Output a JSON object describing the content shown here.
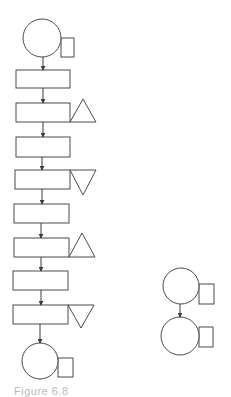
{
  "diagram": {
    "type": "process-flow-chart",
    "stroke_color": "#4a4a4a",
    "background": "#ffffff",
    "main_chain": {
      "start": {
        "shape": "operation-circle-with-tab",
        "cx": 42,
        "cy": 38,
        "r": 19,
        "tab": {
          "x": 61,
          "y": 38,
          "w": 13,
          "h": 19
        }
      },
      "steps": [
        {
          "shape": "rect",
          "x": 16,
          "y": 70,
          "w": 54,
          "h": 18,
          "marker": null
        },
        {
          "shape": "rect",
          "x": 16,
          "y": 103,
          "w": 54,
          "h": 19,
          "marker": {
            "type": "triangle-up",
            "x1": 70,
            "x2": 96,
            "apex_y": 99,
            "base_y": 122
          }
        },
        {
          "shape": "rect",
          "x": 16,
          "y": 137,
          "w": 54,
          "h": 20,
          "marker": null
        },
        {
          "shape": "rect",
          "x": 15,
          "y": 170,
          "w": 55,
          "h": 19,
          "marker": {
            "type": "triangle-down",
            "x1": 70,
            "x2": 96,
            "apex_y": 195,
            "base_y": 170
          }
        },
        {
          "shape": "rect",
          "x": 14,
          "y": 204,
          "w": 55,
          "h": 19,
          "marker": null
        },
        {
          "shape": "rect",
          "x": 14,
          "y": 238,
          "w": 55,
          "h": 19,
          "marker": {
            "type": "triangle-up",
            "x1": 69,
            "x2": 95,
            "apex_y": 233,
            "base_y": 257
          }
        },
        {
          "shape": "rect",
          "x": 13,
          "y": 271,
          "w": 55,
          "h": 19,
          "marker": null
        },
        {
          "shape": "rect",
          "x": 13,
          "y": 305,
          "w": 55,
          "h": 19,
          "marker": {
            "type": "triangle-down",
            "x1": 68,
            "x2": 94,
            "apex_y": 328,
            "base_y": 305
          }
        }
      ],
      "end": {
        "shape": "operation-circle-with-tab",
        "cx": 40,
        "cy": 361,
        "r": 18,
        "tab": {
          "x": 58,
          "y": 358,
          "w": 15,
          "h": 19
        }
      },
      "arrows": [
        {
          "x": 43,
          "y1": 57,
          "y2": 70
        },
        {
          "x": 43,
          "y1": 88,
          "y2": 103
        },
        {
          "x": 43,
          "y1": 122,
          "y2": 137
        },
        {
          "x": 42,
          "y1": 157,
          "y2": 170
        },
        {
          "x": 42,
          "y1": 189,
          "y2": 204
        },
        {
          "x": 41,
          "y1": 223,
          "y2": 238
        },
        {
          "x": 41,
          "y1": 257,
          "y2": 271
        },
        {
          "x": 41,
          "y1": 290,
          "y2": 305
        },
        {
          "x": 40,
          "y1": 324,
          "y2": 343
        }
      ]
    },
    "side_chain": {
      "nodes": [
        {
          "shape": "operation-circle-with-tab",
          "cx": 181,
          "cy": 286,
          "r": 18,
          "tab": {
            "x": 199,
            "y": 284,
            "w": 15,
            "h": 20
          }
        },
        {
          "shape": "operation-circle-with-tab",
          "cx": 180,
          "cy": 336,
          "r": 19,
          "tab": {
            "x": 199,
            "y": 327,
            "w": 14,
            "h": 20
          }
        }
      ],
      "arrows": [
        {
          "x": 180,
          "y1": 304,
          "y2": 317
        }
      ]
    }
  },
  "caption": {
    "text": "Figure 6.8"
  }
}
